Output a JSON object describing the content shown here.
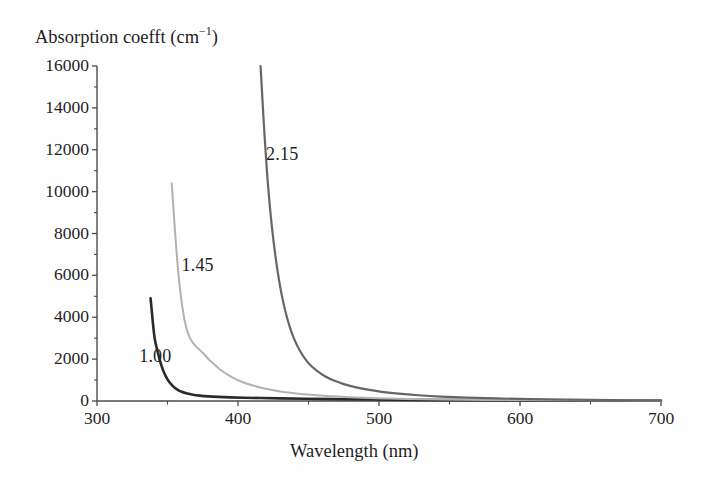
{
  "figure": {
    "background_color": "#fefefe",
    "text_color": "#1f1f1f"
  },
  "axes": {
    "y_title": "Absorption coefft (cm",
    "y_title_exponent": "−1",
    "y_title_close": ")",
    "x_title": "Wavelength (nm)"
  },
  "chart_data": {
    "type": "line",
    "title": "",
    "xlabel": "Wavelength (nm)",
    "ylabel": "Absorption coefft (cm⁻¹)",
    "xlim": [
      300,
      700
    ],
    "ylim": [
      0,
      16000
    ],
    "xticks": [
      300,
      400,
      500,
      600,
      700
    ],
    "xtick_labels": [
      "300",
      "400",
      "500",
      "600",
      "700"
    ],
    "x_minor_ticks": [
      350,
      450,
      550,
      650
    ],
    "yticks": [
      0,
      2000,
      4000,
      6000,
      8000,
      10000,
      12000,
      14000,
      16000
    ],
    "ytick_labels": [
      "0",
      "2000",
      "4000",
      "6000",
      "8000",
      "10000",
      "12000",
      "14000",
      "16000"
    ],
    "y_minor_ticks": [
      1000,
      3000,
      5000,
      7000,
      9000,
      11000,
      13000,
      15000
    ],
    "grid": false,
    "legend": "inline-curve-labels",
    "series": [
      {
        "name": "1.00",
        "label": "1.00",
        "color": "#2a2a2a",
        "width": 2.6,
        "label_x": 342,
        "label_y": 2150,
        "points": [
          [
            338,
            4900
          ],
          [
            339,
            4200
          ],
          [
            340,
            3500
          ],
          [
            341,
            2950
          ],
          [
            343,
            2350
          ],
          [
            345,
            1850
          ],
          [
            347,
            1450
          ],
          [
            349,
            1150
          ],
          [
            351,
            930
          ],
          [
            354,
            700
          ],
          [
            357,
            545
          ],
          [
            360,
            440
          ],
          [
            364,
            355
          ],
          [
            368,
            300
          ],
          [
            373,
            255
          ],
          [
            379,
            220
          ],
          [
            386,
            195
          ],
          [
            394,
            175
          ],
          [
            404,
            158
          ],
          [
            416,
            142
          ],
          [
            430,
            125
          ],
          [
            448,
            108
          ],
          [
            470,
            90
          ],
          [
            496,
            72
          ],
          [
            526,
            56
          ],
          [
            560,
            42
          ],
          [
            600,
            30
          ],
          [
            645,
            20
          ],
          [
            700,
            14
          ]
        ]
      },
      {
        "name": "1.45",
        "label": "1.45",
        "color": "#b2b2b2",
        "width": 2.0,
        "label_x": 372,
        "label_y": 6500,
        "points": [
          [
            353,
            10400
          ],
          [
            354,
            9400
          ],
          [
            355,
            8400
          ],
          [
            356,
            7500
          ],
          [
            357,
            6650
          ],
          [
            358,
            5900
          ],
          [
            360,
            4750
          ],
          [
            362,
            3900
          ],
          [
            364,
            3350
          ],
          [
            366,
            3000
          ],
          [
            368,
            2780
          ],
          [
            370,
            2620
          ],
          [
            373,
            2430
          ],
          [
            376,
            2230
          ],
          [
            379,
            2010
          ],
          [
            383,
            1760
          ],
          [
            387,
            1520
          ],
          [
            392,
            1290
          ],
          [
            397,
            1090
          ],
          [
            403,
            910
          ],
          [
            410,
            750
          ],
          [
            418,
            610
          ],
          [
            427,
            490
          ],
          [
            437,
            390
          ],
          [
            449,
            305
          ],
          [
            463,
            235
          ],
          [
            479,
            180
          ],
          [
            498,
            135
          ],
          [
            520,
            100
          ],
          [
            546,
            74
          ],
          [
            576,
            52
          ],
          [
            612,
            35
          ],
          [
            654,
            23
          ],
          [
            700,
            15
          ]
        ]
      },
      {
        "name": "2.15",
        "label": "2.15",
        "color": "#666666",
        "width": 2.2,
        "label_x": 432,
        "label_y": 11800,
        "points": [
          [
            416,
            16000
          ],
          [
            417,
            14800
          ],
          [
            418,
            13600
          ],
          [
            419,
            12500
          ],
          [
            420,
            11500
          ],
          [
            421,
            10550
          ],
          [
            423,
            9000
          ],
          [
            425,
            7750
          ],
          [
            427,
            6700
          ],
          [
            429,
            5820
          ],
          [
            431,
            5070
          ],
          [
            434,
            4180
          ],
          [
            437,
            3480
          ],
          [
            440,
            2930
          ],
          [
            444,
            2390
          ],
          [
            448,
            1980
          ],
          [
            452,
            1670
          ],
          [
            457,
            1390
          ],
          [
            462,
            1170
          ],
          [
            468,
            975
          ],
          [
            475,
            805
          ],
          [
            483,
            660
          ],
          [
            492,
            540
          ],
          [
            502,
            440
          ],
          [
            514,
            350
          ],
          [
            528,
            275
          ],
          [
            544,
            212
          ],
          [
            562,
            163
          ],
          [
            583,
            122
          ],
          [
            607,
            90
          ],
          [
            634,
            64
          ],
          [
            665,
            42
          ],
          [
            700,
            26
          ]
        ]
      }
    ]
  },
  "geometry": {
    "plot_left_px": 97,
    "plot_right_px": 661,
    "plot_top_px": 66,
    "plot_bottom_px": 401
  }
}
